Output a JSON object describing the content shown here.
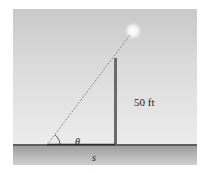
{
  "figure": {
    "pole_height_label": "50 ft",
    "angle_label": "θ",
    "shadow_label": "s"
  },
  "colors": {
    "sky_top": "#c9c9c9",
    "sky_bottom": "#ececec",
    "ground": "#a8a8a8",
    "pole": "#6b6b6b",
    "shadow": "#2f2f2f",
    "light": "#ffffff",
    "ray": "#8a8a8a"
  }
}
